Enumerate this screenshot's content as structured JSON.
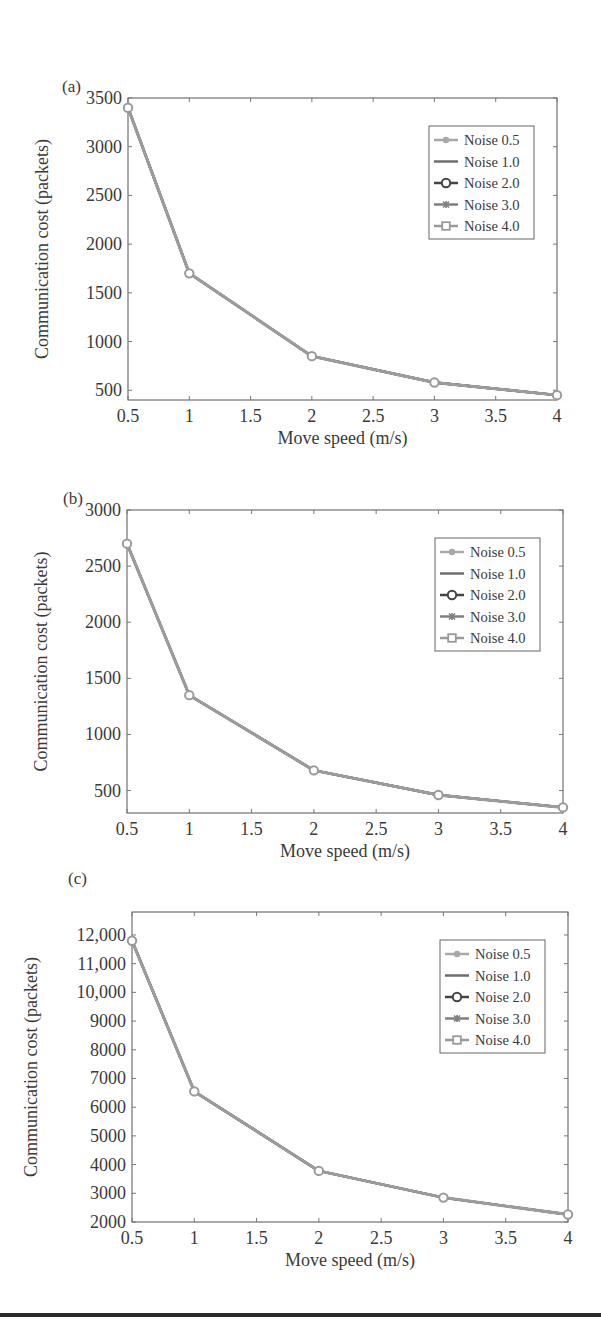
{
  "figure": {
    "panels": [
      "(a)",
      "(b)",
      "(c)"
    ]
  },
  "chart_data": [
    {
      "type": "line",
      "panel_label": "(a)",
      "title": "",
      "xlabel": "Move speed (m/s)",
      "ylabel": "Communication cost (packets)",
      "x": [
        0.5,
        1,
        2,
        3,
        4
      ],
      "xlim": [
        0.5,
        4
      ],
      "ylim": [
        400,
        3500
      ],
      "x_ticks": [
        0.5,
        1,
        1.5,
        2,
        2.5,
        3,
        3.5,
        4
      ],
      "x_tick_labels": [
        "0.5",
        "1",
        "1.5",
        "2",
        "2.5",
        "3",
        "3.5",
        "4"
      ],
      "y_ticks": [
        500,
        1000,
        1500,
        2000,
        2500,
        3000,
        3500
      ],
      "y_tick_labels": [
        "500",
        "1000",
        "1500",
        "2000",
        "2500",
        "3000",
        "3500"
      ],
      "grid": false,
      "legend_position": "upper right",
      "series": [
        {
          "name": "Noise 0.5",
          "marker": "dot",
          "color": "#a8a8a8",
          "values": [
            3400,
            1700,
            850,
            580,
            450
          ]
        },
        {
          "name": "Noise 1.0",
          "marker": "none",
          "color": "#6e6e6e",
          "values": [
            3400,
            1700,
            850,
            580,
            450
          ]
        },
        {
          "name": "Noise 2.0",
          "marker": "circle",
          "color": "#444444",
          "values": [
            3400,
            1700,
            850,
            580,
            450
          ]
        },
        {
          "name": "Noise 3.0",
          "marker": "star",
          "color": "#808080",
          "values": [
            3400,
            1700,
            850,
            580,
            450
          ]
        },
        {
          "name": "Noise 4.0",
          "marker": "square",
          "color": "#9a9a9a",
          "values": [
            3400,
            1700,
            850,
            580,
            450
          ]
        }
      ],
      "layout": {
        "left": 128,
        "top": 98,
        "right": 557,
        "bottom": 400,
        "label_x": 62,
        "label_y": 92
      }
    },
    {
      "type": "line",
      "panel_label": "(b)",
      "title": "",
      "xlabel": "Move speed (m/s)",
      "ylabel": "Communication cost (packets)",
      "x": [
        0.5,
        1,
        2,
        3,
        4
      ],
      "xlim": [
        0.5,
        4
      ],
      "ylim": [
        300,
        3000
      ],
      "x_ticks": [
        0.5,
        1,
        1.5,
        2,
        2.5,
        3,
        3.5,
        4
      ],
      "x_tick_labels": [
        "0.5",
        "1",
        "1.5",
        "2",
        "2.5",
        "3",
        "3.5",
        "4"
      ],
      "y_ticks": [
        500,
        1000,
        1500,
        2000,
        2500,
        3000
      ],
      "y_tick_labels": [
        "500",
        "1000",
        "1500",
        "2000",
        "2500",
        "3000"
      ],
      "grid": false,
      "legend_position": "upper right",
      "series": [
        {
          "name": "Noise 0.5",
          "marker": "dot",
          "color": "#a8a8a8",
          "values": [
            2700,
            1350,
            680,
            460,
            350
          ]
        },
        {
          "name": "Noise 1.0",
          "marker": "none",
          "color": "#6e6e6e",
          "values": [
            2700,
            1350,
            680,
            460,
            350
          ]
        },
        {
          "name": "Noise 2.0",
          "marker": "circle",
          "color": "#444444",
          "values": [
            2700,
            1350,
            680,
            460,
            350
          ]
        },
        {
          "name": "Noise 3.0",
          "marker": "star",
          "color": "#808080",
          "values": [
            2700,
            1350,
            680,
            460,
            350
          ]
        },
        {
          "name": "Noise 4.0",
          "marker": "square",
          "color": "#9a9a9a",
          "values": [
            2700,
            1350,
            680,
            460,
            350
          ]
        }
      ],
      "layout": {
        "left": 127,
        "top": 510,
        "right": 563,
        "bottom": 813,
        "label_x": 63,
        "label_y": 504
      }
    },
    {
      "type": "line",
      "panel_label": "(c)",
      "title": "",
      "xlabel": "Move speed (m/s)",
      "ylabel": "Communication cost (packets)",
      "x": [
        0.5,
        1,
        2,
        3,
        4
      ],
      "xlim": [
        0.5,
        4
      ],
      "ylim": [
        2000,
        12800
      ],
      "x_ticks": [
        0.5,
        1,
        1.5,
        2,
        2.5,
        3,
        3.5,
        4
      ],
      "x_tick_labels": [
        "0.5",
        "1",
        "1.5",
        "2",
        "2.5",
        "3",
        "3.5",
        "4"
      ],
      "y_ticks": [
        2000,
        3000,
        4000,
        5000,
        6000,
        7000,
        8000,
        9000,
        10000,
        11000,
        12000
      ],
      "y_tick_labels": [
        "2000",
        "3000",
        "4000",
        "5000",
        "6000",
        "7000",
        "8000",
        "9000",
        "10,000",
        "11,000",
        "12,000"
      ],
      "grid": false,
      "legend_position": "upper right",
      "series": [
        {
          "name": "Noise 0.5",
          "marker": "dot",
          "color": "#a8a8a8",
          "values": [
            11800,
            6550,
            3780,
            2850,
            2260
          ]
        },
        {
          "name": "Noise 1.0",
          "marker": "none",
          "color": "#6e6e6e",
          "values": [
            11800,
            6550,
            3780,
            2850,
            2260
          ]
        },
        {
          "name": "Noise 2.0",
          "marker": "circle",
          "color": "#444444",
          "values": [
            11800,
            6550,
            3780,
            2850,
            2260
          ]
        },
        {
          "name": "Noise 3.0",
          "marker": "star",
          "color": "#808080",
          "values": [
            11800,
            6550,
            3780,
            2850,
            2260
          ]
        },
        {
          "name": "Noise 4.0",
          "marker": "square",
          "color": "#9a9a9a",
          "values": [
            11800,
            6550,
            3780,
            2850,
            2260
          ]
        }
      ],
      "layout": {
        "left": 132,
        "top": 912,
        "right": 568,
        "bottom": 1222,
        "label_x": 68,
        "label_y": 884
      }
    }
  ]
}
